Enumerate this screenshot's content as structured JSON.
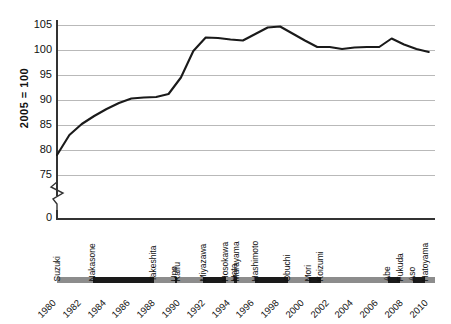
{
  "chart_data": {
    "type": "line",
    "title": "",
    "subtitle": "",
    "xlabel": "",
    "ylabel": "2005 = 100",
    "xlim": [
      1980,
      2010
    ],
    "ylim": [
      75,
      105
    ],
    "grid": true,
    "legend": "none",
    "y_ticks": [
      0,
      75,
      80,
      85,
      90,
      95,
      100,
      105
    ],
    "y_axis_break": true,
    "y_axis_break_note": "axis broken between 0 and 75",
    "x_ticks": [
      1980,
      1982,
      1984,
      1986,
      1988,
      1990,
      1992,
      1994,
      1996,
      1998,
      2000,
      2002,
      2004,
      2006,
      2008,
      2010
    ],
    "x": [
      1980,
      1981,
      1982,
      1983,
      1984,
      1985,
      1986,
      1987,
      1988,
      1989,
      1990,
      1991,
      1992,
      1993,
      1994,
      1995,
      1996,
      1997,
      1998,
      1999,
      2000,
      2001,
      2002,
      2003,
      2004,
      2005,
      2006,
      2007,
      2008,
      2009,
      2010
    ],
    "series": [
      {
        "name": "Index (2005 = 100)",
        "color": "#1a1a1a",
        "values": [
          79.0,
          83.0,
          85.2,
          86.8,
          88.2,
          89.4,
          90.3,
          90.5,
          90.6,
          91.2,
          94.5,
          99.8,
          102.5,
          102.4,
          102.1,
          101.9,
          103.2,
          104.5,
          104.7,
          103.3,
          101.9,
          100.6,
          100.6,
          100.2,
          100.5,
          100.6,
          100.6,
          102.3,
          101.1,
          100.2,
          99.6
        ]
      }
    ],
    "prime_ministers": [
      {
        "name": "Suzuki",
        "start": 1980.0,
        "end": 1982.9,
        "shade": "light"
      },
      {
        "name": "Nakasone",
        "start": 1982.9,
        "end": 1987.8,
        "shade": "dark"
      },
      {
        "name": "Takeshita",
        "start": 1987.8,
        "end": 1989.5,
        "shade": "light"
      },
      {
        "name": "Uno",
        "start": 1989.5,
        "end": 1989.7,
        "shade": "dark"
      },
      {
        "name": "Kaifu",
        "start": 1989.7,
        "end": 1991.8,
        "shade": "light"
      },
      {
        "name": "Miyazawa",
        "start": 1991.8,
        "end": 1993.6,
        "shade": "dark"
      },
      {
        "name": "Hosokawa",
        "start": 1993.6,
        "end": 1994.3,
        "shade": "light"
      },
      {
        "name": "Hata",
        "start": 1994.3,
        "end": 1994.5,
        "shade": "dark"
      },
      {
        "name": "Murayama",
        "start": 1994.5,
        "end": 1996.0,
        "shade": "light"
      },
      {
        "name": "Hashimoto",
        "start": 1996.0,
        "end": 1998.6,
        "shade": "dark"
      },
      {
        "name": "Obuchi",
        "start": 1998.6,
        "end": 2000.3,
        "shade": "light"
      },
      {
        "name": "Mori",
        "start": 2000.3,
        "end": 2001.3,
        "shade": "dark"
      },
      {
        "name": "Koizumi",
        "start": 2001.3,
        "end": 2006.7,
        "shade": "light"
      },
      {
        "name": "Abe",
        "start": 2006.7,
        "end": 2007.7,
        "shade": "dark"
      },
      {
        "name": "Fukuda",
        "start": 2007.7,
        "end": 2008.7,
        "shade": "light"
      },
      {
        "name": "Aso",
        "start": 2008.7,
        "end": 2009.7,
        "shade": "dark"
      },
      {
        "name": "Hatoyama",
        "start": 2009.7,
        "end": 2010.5,
        "shade": "light"
      }
    ]
  }
}
